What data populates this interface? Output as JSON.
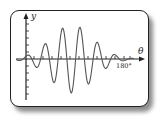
{
  "diagram": {
    "type": "wave-packet-graph",
    "axes": {
      "x_label": "θ",
      "y_label": "y",
      "x_tick_label": "180°"
    },
    "colors": {
      "curve": "#555555",
      "axes": "#222222",
      "frame": "#222222",
      "shadow": "#555555"
    }
  },
  "chart_data": {
    "type": "line",
    "title": "",
    "xlabel": "θ",
    "ylabel": "y",
    "x_ticks": [
      "180°"
    ],
    "peaks_relative_amplitude": [
      0.15,
      0.55,
      1.0,
      1.0,
      0.8,
      0.35,
      0.1
    ],
    "grid": false,
    "legend": null
  }
}
